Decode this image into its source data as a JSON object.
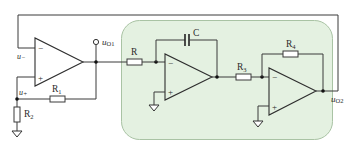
{
  "diagram": {
    "type": "circuit-schematic",
    "colors": {
      "panel_fill": "#e4f1e1",
      "panel_stroke": "#a9c3a4",
      "wire": "#3a3a3a",
      "background": "#ffffff"
    },
    "labels": {
      "u_minus": "u",
      "u_minus_sub": "−",
      "u_plus": "u",
      "u_plus_sub": "+",
      "uo1": "u",
      "uo1_sub": "O1",
      "uo2": "u",
      "uo2_sub": "O2",
      "R": "R",
      "C": "C",
      "R1": "R",
      "R1_sub": "1",
      "R2": "R",
      "R2_sub": "2",
      "R3": "R",
      "R3_sub": "3",
      "R4": "R",
      "R4_sub": "4"
    },
    "opamps": [
      {
        "id": "A1",
        "role": "comparator",
        "minus": "−",
        "plus": "+"
      },
      {
        "id": "A2",
        "role": "integrator",
        "minus": "−",
        "plus": "+"
      },
      {
        "id": "A3",
        "role": "inverting-amplifier",
        "minus": "−",
        "plus": "+"
      }
    ]
  }
}
